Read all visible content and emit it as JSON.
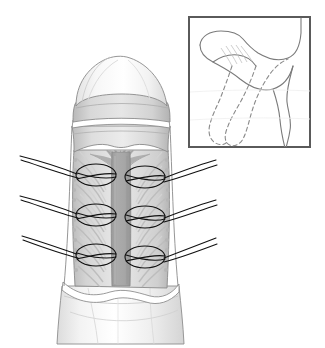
{
  "figure": {
    "kind": "medical-surgical-illustration",
    "style": "grayscale-line-drawing",
    "caption": "Longitudinal sectional view of the degloved phallus showing the exposed septum and paired rows of plication sutures placed on either side; inset depicts the corrected curvature.",
    "background_color": "#ffffff",
    "width": 325,
    "height": 348
  },
  "palette": {
    "outline": "#6e6e6e",
    "outline_dark": "#4a4a4a",
    "suture_thread": "#111111",
    "inset_border": "#5a5a5a",
    "skin_light": "#fbfbfb",
    "skin_shade": "#ededed",
    "corona_band": "#c9c9c9",
    "corona_band_light": "#e2e2e2",
    "cavity_fill": "#dcdcdc",
    "cavity_shade": "#cfcfcf",
    "septum_band": "#a8a8a8",
    "septum_band_edge": "#9b9b9b",
    "tissue_stripe": "#c2c2c2",
    "base_shaft": "#f4f4f4",
    "white_margin": "#ffffff"
  },
  "main_figure": {
    "name": "degloved-phallus-longitudinal-view",
    "parts": [
      {
        "id": "glans",
        "label": "Glans (distal dome)",
        "tone": "#fafafa"
      },
      {
        "id": "corona-band-upper",
        "label": "Coronal ridge band",
        "tone": "#cdcdcd"
      },
      {
        "id": "corona-band-lower",
        "label": "Sub-coronal sulcus band",
        "tone": "#d6d6d6"
      },
      {
        "id": "cavity",
        "label": "Opened tunica / corporal cavity",
        "tone": "#dadada"
      },
      {
        "id": "septum",
        "label": "Central septum column",
        "tone": "#a8a8a8"
      },
      {
        "id": "septum-fan",
        "label": "Distal septal fan / arborization",
        "tone": "#b4b4b4"
      },
      {
        "id": "shaft-base",
        "label": "Proximal shaft (retracted skin)",
        "tone": "#f5f5f5"
      }
    ]
  },
  "sutures": {
    "name": "plication-suture-set",
    "count_total": 6,
    "rows": 3,
    "columns": 2,
    "tails_per_suture": 2,
    "thread_color": "#111111",
    "items": [
      {
        "id": "suture-L1",
        "side": "left",
        "row": 1,
        "cx": 96,
        "cy": 175,
        "rx": 20,
        "ry": 11
      },
      {
        "id": "suture-R1",
        "side": "right",
        "row": 1,
        "cx": 145,
        "cy": 177,
        "rx": 20,
        "ry": 11
      },
      {
        "id": "suture-L2",
        "side": "left",
        "row": 2,
        "cx": 96,
        "cy": 215,
        "rx": 20,
        "ry": 11
      },
      {
        "id": "suture-R2",
        "side": "right",
        "row": 2,
        "cx": 145,
        "cy": 217,
        "rx": 20,
        "ry": 11
      },
      {
        "id": "suture-L3",
        "side": "left",
        "row": 3,
        "cx": 96,
        "cy": 255,
        "rx": 20,
        "ry": 11
      },
      {
        "id": "suture-R3",
        "side": "right",
        "row": 3,
        "cx": 145,
        "cy": 257,
        "rx": 20,
        "ry": 11
      }
    ],
    "tail_endpoints_left": [
      {
        "row": 1,
        "x": 20,
        "y": 156
      },
      {
        "row": 2,
        "x": 20,
        "y": 196
      },
      {
        "row": 3,
        "x": 22,
        "y": 236
      }
    ],
    "tail_endpoints_right": [
      {
        "row": 1,
        "x": 216,
        "y": 160
      },
      {
        "row": 2,
        "x": 216,
        "y": 200
      },
      {
        "row": 3,
        "x": 216,
        "y": 238
      }
    ]
  },
  "inset": {
    "name": "orientation-inset",
    "label": "Inset: corrected curvature schematic",
    "border_color": "#5a5a5a",
    "border_width": 2,
    "background": "#ffffff",
    "x": 188,
    "y": 16,
    "width": 123,
    "height": 132,
    "contents": [
      {
        "id": "solid-shaft-outline",
        "style": "solid",
        "label": "Post-correction (straightened) outline"
      },
      {
        "id": "crossing-limb-outline",
        "style": "solid",
        "label": "Crossing anatomic limb"
      },
      {
        "id": "dashed-shaft-outline",
        "style": "dashed",
        "label": "Pre-correction (curved) outline"
      }
    ]
  },
  "annotations": {
    "text_labels": [],
    "has_visible_text": false
  }
}
